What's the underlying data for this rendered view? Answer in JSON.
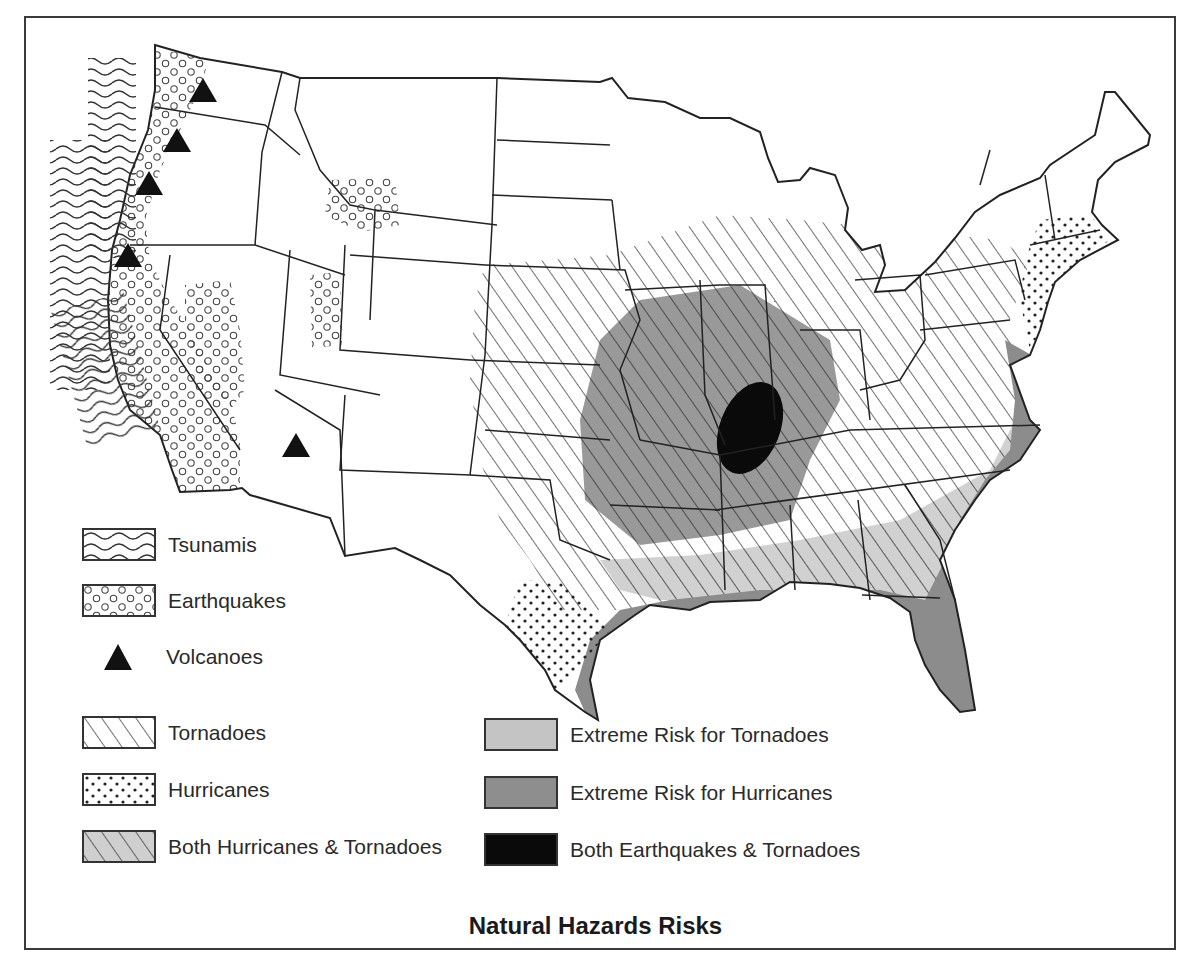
{
  "map": {
    "title": "Natural Hazards Risks",
    "region": "Contiguous United States",
    "colors": {
      "outline": "#222222",
      "extreme_tornado": "#c4c4c4",
      "extreme_hurricane": "#8e8e8e",
      "earthquake_tornado": "#0a0a0a",
      "background": "#ffffff"
    },
    "hazard_zones": [
      {
        "hazard": "Tsunamis",
        "area": "Pacific coast offshore"
      },
      {
        "hazard": "Earthquakes",
        "area": "West coast, Nevada, Yellowstone, Utah"
      },
      {
        "hazard": "Volcanoes",
        "area": "Cascades and Arizona",
        "count": 5
      },
      {
        "hazard": "Tornadoes",
        "area": "Great Plains, Midwest, Southeast"
      },
      {
        "hazard": "Hurricanes",
        "area": "South Texas coast and Mid-Atlantic/New England coast"
      },
      {
        "hazard": "Extreme Risk for Tornadoes",
        "area": "Central Mississippi Valley"
      },
      {
        "hazard": "Extreme Risk for Hurricanes",
        "area": "Gulf and Southeast Atlantic coast"
      },
      {
        "hazard": "Both Earthquakes & Tornadoes",
        "area": "New Madrid region"
      }
    ]
  },
  "legend": {
    "left": [
      {
        "label": "Tsunamis",
        "pattern": "waves"
      },
      {
        "label": "Earthquakes",
        "pattern": "circles"
      },
      {
        "label": "Volcanoes",
        "pattern": "triangle"
      },
      {
        "label": "Tornadoes",
        "pattern": "diagonal-lines"
      },
      {
        "label": "Hurricanes",
        "pattern": "dots"
      },
      {
        "label": "Both Hurricanes & Tornadoes",
        "pattern": "diagonal-lines-gray"
      }
    ],
    "right": [
      {
        "label": "Extreme Risk for Tornadoes",
        "pattern": "light-gray"
      },
      {
        "label": "Extreme Risk for Hurricanes",
        "pattern": "dark-gray"
      },
      {
        "label": "Both Earthquakes & Tornadoes",
        "pattern": "black"
      }
    ]
  }
}
